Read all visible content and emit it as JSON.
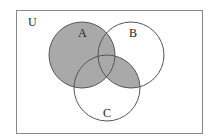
{
  "diagram": {
    "type": "venn",
    "universe_label": "U",
    "sets": [
      {
        "name": "A",
        "label": "A"
      },
      {
        "name": "B",
        "label": "B"
      },
      {
        "name": "C",
        "label": "C"
      }
    ],
    "shaded_region": "A ∪ (B ∩ C)",
    "colors": {
      "shade": "#a9a9a9",
      "stroke": "#555555",
      "frame": "#888888"
    }
  }
}
